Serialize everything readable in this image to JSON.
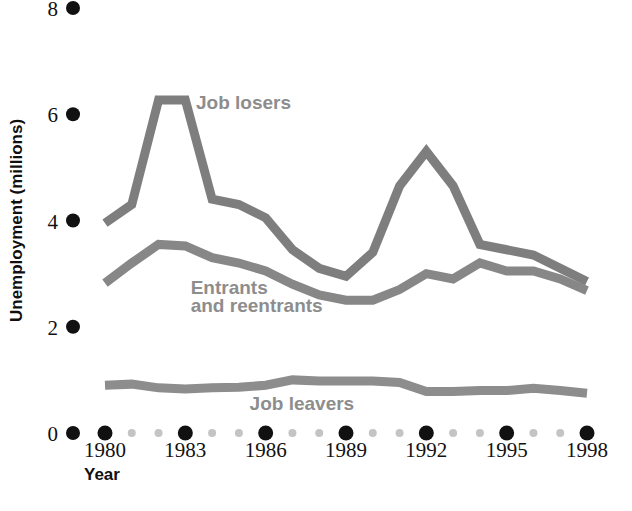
{
  "chart_data": {
    "type": "line",
    "title": "",
    "xlabel": "Year",
    "ylabel": "Unemployment (millions)",
    "xlim": [
      1980,
      1998
    ],
    "ylim": [
      0,
      8
    ],
    "grid": false,
    "legend_position": "inline-labels",
    "x": [
      1980,
      1981,
      1982,
      1983,
      1984,
      1985,
      1986,
      1987,
      1988,
      1989,
      1990,
      1991,
      1992,
      1993,
      1994,
      1995,
      1996,
      1997,
      1998
    ],
    "x_tick_labels": [
      "1980",
      "1983",
      "1986",
      "1989",
      "1992",
      "1995",
      "1998"
    ],
    "x_tick_values": [
      1980,
      1983,
      1986,
      1989,
      1992,
      1995,
      1998
    ],
    "x_minor_values": [
      1981,
      1982,
      1984,
      1985,
      1987,
      1988,
      1990,
      1991,
      1993,
      1994,
      1996,
      1997
    ],
    "y_tick_labels": [
      "0",
      "2",
      "4",
      "6",
      "8"
    ],
    "y_tick_values": [
      0,
      2,
      4,
      6,
      8
    ],
    "series": [
      {
        "name": "Job losers",
        "color": "#7e7e7e",
        "label_x": 1983.4,
        "label_y": 6.1,
        "values": [
          3.95,
          4.3,
          6.27,
          6.27,
          4.4,
          4.3,
          4.05,
          3.45,
          3.1,
          2.95,
          3.4,
          4.65,
          5.3,
          4.65,
          3.55,
          3.45,
          3.35,
          3.1,
          2.85
        ]
      },
      {
        "name": "Entrants and reentrants",
        "color": "#878787",
        "label_x": 1983.2,
        "label_y": 2.62,
        "label_line2_y": 2.28,
        "values": [
          2.82,
          3.2,
          3.55,
          3.52,
          3.3,
          3.2,
          3.05,
          2.8,
          2.6,
          2.5,
          2.5,
          2.7,
          3.0,
          2.9,
          3.2,
          3.05,
          3.05,
          2.9,
          2.68
        ]
      },
      {
        "name": "Job leavers",
        "color": "#8d8d8d",
        "label_x": 1985.4,
        "label_y": 0.44,
        "values": [
          0.9,
          0.92,
          0.85,
          0.83,
          0.85,
          0.86,
          0.9,
          1.0,
          0.98,
          0.98,
          0.98,
          0.95,
          0.78,
          0.78,
          0.8,
          0.8,
          0.84,
          0.8,
          0.75
        ]
      }
    ]
  },
  "labels": {
    "series_job_losers": "Job losers",
    "series_entrants_line1": "Entrants",
    "series_entrants_line2": "and reentrants",
    "series_job_leavers": "Job leavers",
    "y_axis_title": "Unemployment (millions)",
    "x_axis_title": "Year"
  },
  "colors": {
    "tick_dot_major": "#111111",
    "tick_dot_minor": "#c4c4c4",
    "background": "#ffffff",
    "label_text": "#8d8d8d",
    "axis_text": "#111111"
  }
}
